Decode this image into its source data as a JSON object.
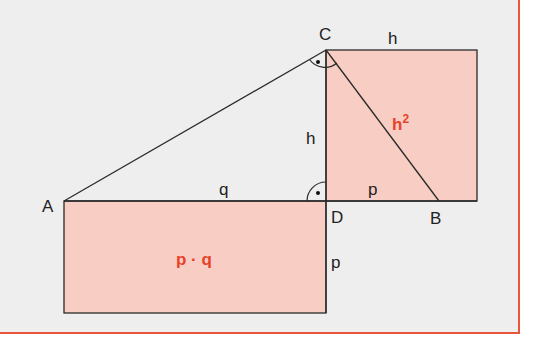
{
  "colors": {
    "background": "#eeeeee",
    "frame": "#e8553a",
    "fill": "#f8cec4",
    "stroke": "#2a2a2a",
    "accent_label": "#e8432a"
  },
  "points": {
    "A": {
      "label": "A",
      "x": 64,
      "y": 201
    },
    "B": {
      "label": "B",
      "x": 439,
      "y": 201
    },
    "C": {
      "label": "C",
      "x": 326,
      "y": 50
    },
    "D": {
      "label": "D",
      "x": 326,
      "y": 201
    }
  },
  "segments": {
    "q": "q",
    "p_base": "p",
    "h_altitude": "h",
    "h_square_top": "h",
    "p_rect_side": "p"
  },
  "areas": {
    "square": {
      "label_base": "h",
      "label_exp": "2"
    },
    "rectangle": {
      "label": "p · q"
    }
  }
}
